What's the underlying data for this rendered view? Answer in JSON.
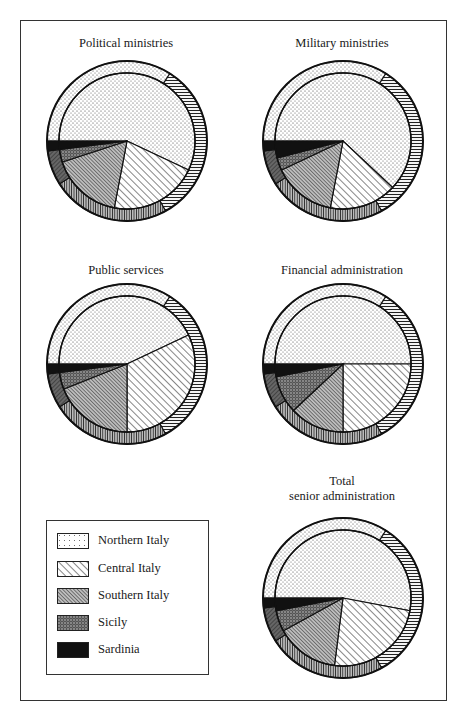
{
  "page": {
    "frame": true
  },
  "legend": {
    "items": [
      {
        "key": "north",
        "label": "Northern Italy",
        "pattern": "dots"
      },
      {
        "key": "central",
        "label": "Central Italy",
        "pattern": "diagonal-stripes"
      },
      {
        "key": "south",
        "label": "Southern Italy",
        "pattern": "dense-diagonal"
      },
      {
        "key": "sicily",
        "label": "Sicily",
        "pattern": "dark-crosshatch"
      },
      {
        "key": "sardinia",
        "label": "Sardinia",
        "pattern": "solid-black"
      }
    ]
  },
  "chart_data": [
    {
      "type": "pie",
      "title": "Political ministries",
      "categories": [
        "Northern Italy",
        "Central Italy",
        "Southern Italy",
        "Sicily",
        "Sardinia"
      ],
      "values": [
        57,
        21,
        17,
        3,
        2
      ],
      "outer_ring_values": [
        34,
        33,
        24,
        7,
        2
      ],
      "notes": "Inner pie = senior officials by region of origin; outer ring = comparison distribution (estimated)"
    },
    {
      "type": "pie",
      "title": "Military ministries",
      "categories": [
        "Northern Italy",
        "Central Italy",
        "Southern Italy",
        "Sicily",
        "Sardinia"
      ],
      "values": [
        62,
        16,
        15,
        3,
        4
      ],
      "outer_ring_values": [
        34,
        33,
        24,
        7,
        2
      ]
    },
    {
      "type": "pie",
      "title": "Public services",
      "categories": [
        "Northern Italy",
        "Central Italy",
        "Southern Italy",
        "Sicily",
        "Sardinia"
      ],
      "values": [
        43,
        32,
        19,
        4,
        2
      ],
      "outer_ring_values": [
        34,
        33,
        24,
        7,
        2
      ]
    },
    {
      "type": "pie",
      "title": "Financial administration",
      "categories": [
        "Northern Italy",
        "Central Italy",
        "Southern Italy",
        "Sicily",
        "Sardinia"
      ],
      "values": [
        50,
        25,
        13,
        9,
        3
      ],
      "outer_ring_values": [
        34,
        33,
        24,
        7,
        2
      ]
    },
    {
      "type": "pie",
      "title": "Total senior administration",
      "title_lines": [
        "Total",
        "senior administration"
      ],
      "categories": [
        "Northern Italy",
        "Central Italy",
        "Southern Italy",
        "Sicily",
        "Sardinia"
      ],
      "values": [
        53,
        24,
        15,
        5,
        3
      ],
      "outer_ring_values": [
        34,
        33,
        24,
        7,
        2
      ]
    }
  ]
}
